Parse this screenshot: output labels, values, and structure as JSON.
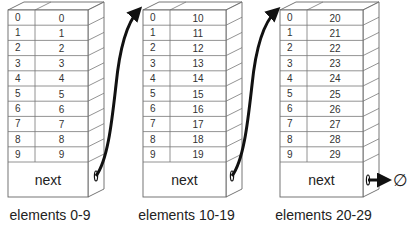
{
  "diagram": {
    "blocks": [
      {
        "caption": "elements 0-9",
        "next_label": "next",
        "rows": [
          {
            "index": "0",
            "value": "0"
          },
          {
            "index": "1",
            "value": "1"
          },
          {
            "index": "2",
            "value": "2"
          },
          {
            "index": "3",
            "value": "3"
          },
          {
            "index": "4",
            "value": "4"
          },
          {
            "index": "5",
            "value": "5"
          },
          {
            "index": "6",
            "value": "6"
          },
          {
            "index": "7",
            "value": "7"
          },
          {
            "index": "8",
            "value": "8"
          },
          {
            "index": "9",
            "value": "9"
          }
        ]
      },
      {
        "caption": "elements 10-19",
        "next_label": "next",
        "rows": [
          {
            "index": "0",
            "value": "10"
          },
          {
            "index": "1",
            "value": "11"
          },
          {
            "index": "2",
            "value": "12"
          },
          {
            "index": "3",
            "value": "13"
          },
          {
            "index": "4",
            "value": "14"
          },
          {
            "index": "5",
            "value": "15"
          },
          {
            "index": "6",
            "value": "16"
          },
          {
            "index": "7",
            "value": "17"
          },
          {
            "index": "8",
            "value": "18"
          },
          {
            "index": "9",
            "value": "19"
          }
        ]
      },
      {
        "caption": "elements 20-29",
        "next_label": "next",
        "rows": [
          {
            "index": "0",
            "value": "20"
          },
          {
            "index": "1",
            "value": "21"
          },
          {
            "index": "2",
            "value": "22"
          },
          {
            "index": "3",
            "value": "23"
          },
          {
            "index": "4",
            "value": "24"
          },
          {
            "index": "5",
            "value": "25"
          },
          {
            "index": "6",
            "value": "26"
          },
          {
            "index": "7",
            "value": "27"
          },
          {
            "index": "8",
            "value": "28"
          },
          {
            "index": "9",
            "value": "29"
          }
        ]
      }
    ],
    "terminator": {
      "symbol": "∅",
      "meaning": "null pointer"
    },
    "arrows": [
      {
        "from": "block-0-next",
        "to": "block-1-top"
      },
      {
        "from": "block-1-next",
        "to": "block-2-top"
      },
      {
        "from": "block-2-next",
        "to": "null"
      }
    ]
  }
}
